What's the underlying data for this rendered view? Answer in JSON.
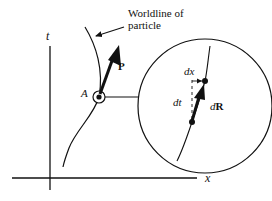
{
  "diagram": {
    "type": "spacetime-worldline",
    "axes": {
      "vertical_label": "t",
      "horizontal_label": "x"
    },
    "worldline_caption_line1": "Worldline of",
    "worldline_caption_line2": "particle",
    "point_label": "A",
    "momentum_label": "P",
    "inset": {
      "dx_label": "dx",
      "dt_label": "dt",
      "dR_label_d": "d",
      "dR_label_R": "R"
    },
    "colors": {
      "ink": "#111111",
      "background": "#ffffff"
    }
  }
}
